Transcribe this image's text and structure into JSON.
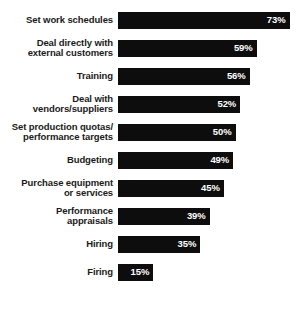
{
  "chart_data": {
    "type": "bar",
    "orientation": "horizontal",
    "title": "",
    "subtitle": "",
    "xlabel": "",
    "ylabel": "",
    "xlim": [
      0,
      80
    ],
    "grid": false,
    "legend": false,
    "value_suffix": "%",
    "bar_color": "#0d0d0d",
    "value_label_color": "#ffffff",
    "category_label_color": "#1a1a1a",
    "background_color": "#ffffff",
    "categories": [
      "Set work schedules",
      "Deal directly with\nexternal customers",
      "Training",
      "Deal with\nvendors/suppliers",
      "Set production quotas/\nperformance targets",
      "Budgeting",
      "Purchase equipment\nor services",
      "Performance\nappraisals",
      "Hiring",
      "Firing"
    ],
    "values": [
      73,
      59,
      56,
      52,
      50,
      49,
      45,
      39,
      35,
      15
    ],
    "value_labels": [
      "73%",
      "59%",
      "56%",
      "52%",
      "50%",
      "49%",
      "45%",
      "39%",
      "35%",
      "15%"
    ]
  }
}
